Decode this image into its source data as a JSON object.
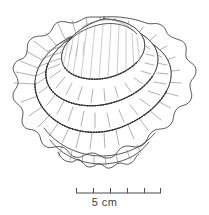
{
  "figure": {
    "view": "oblique top view",
    "technique": "ink line drawing with radiating ribs and beaded tier edges",
    "background_color": "#ffffff",
    "ink_color": "#3a3a3c",
    "width_px": 209,
    "height_px": 215
  },
  "scale_bar": {
    "label": "5 cm",
    "total_length_cm": 5,
    "divisions": 5,
    "tick_count": 6,
    "unit": "cm",
    "bar_left_px": 76,
    "bar_right_px": 161,
    "bar_y_px": 193,
    "tick_height_px": 5,
    "color": "#4a4a4e"
  },
  "drawing": {
    "tiers": [
      {
        "name": "apex-dome",
        "rib_count": 18,
        "edge": "beaded"
      },
      {
        "name": "second-tier",
        "rib_count": 26,
        "edge": "beaded"
      },
      {
        "name": "third-tier",
        "rib_count": 30,
        "edge": "beaded"
      },
      {
        "name": "outer-flange",
        "rib_count": 34,
        "edge": "scalloped"
      }
    ],
    "notes": "concentric scalloped tiers with radiating ribs"
  }
}
